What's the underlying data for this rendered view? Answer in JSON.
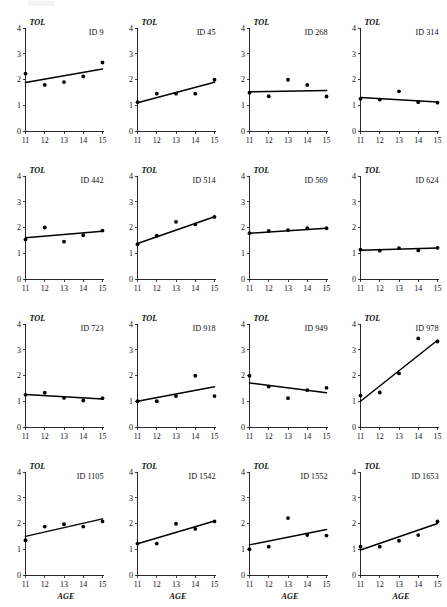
{
  "figure": {
    "panel_count": 16,
    "rows": 4,
    "columns": 4,
    "y_axis_label": "TOL",
    "x_axis_label": "AGE",
    "y_ticks": [
      "0",
      "1",
      "2",
      "3",
      "4"
    ],
    "x_ticks": [
      "11",
      "12",
      "13",
      "14",
      "15"
    ],
    "point_color": "#000000",
    "line_color": "#000000",
    "axis_color": "#111111"
  },
  "chart_data": {
    "type": "scatter",
    "title": "",
    "xlabel": "AGE",
    "ylabel": "TOL",
    "xlim": [
      11,
      15
    ],
    "ylim": [
      0,
      4
    ],
    "x": [
      11,
      12,
      13,
      14,
      15
    ],
    "grid": false,
    "legend": "none",
    "panel_label_prefix": "ID",
    "panels": [
      {
        "id": "ID 9",
        "values": [
          2.23,
          1.79,
          1.9,
          2.12,
          2.66
        ],
        "fit": {
          "y_at_11": 1.88,
          "y_at_15": 2.41
        }
      },
      {
        "id": "ID 45",
        "values": [
          1.12,
          1.45,
          1.45,
          1.45,
          1.99
        ],
        "fit": {
          "y_at_11": 1.1,
          "y_at_15": 1.89
        }
      },
      {
        "id": "ID 268",
        "values": [
          1.49,
          1.35,
          1.99,
          1.79,
          1.34
        ],
        "fit": {
          "y_at_11": 1.52,
          "y_at_15": 1.57
        }
      },
      {
        "id": "ID 314",
        "values": [
          1.25,
          1.22,
          1.54,
          1.12,
          1.1
        ],
        "fit": {
          "y_at_11": 1.3,
          "y_at_15": 1.13
        }
      },
      {
        "id": "ID 442",
        "values": [
          1.53,
          2.0,
          1.45,
          1.7,
          1.88
        ],
        "fit": {
          "y_at_11": 1.6,
          "y_at_15": 1.85
        }
      },
      {
        "id": "ID 514",
        "values": [
          1.35,
          1.68,
          2.22,
          2.12,
          2.41
        ],
        "fit": {
          "y_at_11": 1.38,
          "y_at_15": 2.42
        }
      },
      {
        "id": "ID 569",
        "values": [
          1.78,
          1.87,
          1.9,
          1.97,
          1.97
        ],
        "fit": {
          "y_at_11": 1.78,
          "y_at_15": 1.97
        }
      },
      {
        "id": "ID 624",
        "values": [
          1.14,
          1.1,
          1.2,
          1.11,
          1.21
        ],
        "fit": {
          "y_at_11": 1.12,
          "y_at_15": 1.2
        }
      },
      {
        "id": "ID 723",
        "values": [
          1.25,
          1.33,
          1.13,
          1.03,
          1.12
        ],
        "fit": {
          "y_at_11": 1.26,
          "y_at_15": 1.09
        }
      },
      {
        "id": "ID 918",
        "values": [
          1.0,
          1.0,
          1.2,
          1.99,
          1.2
        ],
        "fit": {
          "y_at_11": 1.0,
          "y_at_15": 1.56
        }
      },
      {
        "id": "ID 949",
        "values": [
          1.99,
          1.57,
          1.12,
          1.43,
          1.52
        ],
        "fit": {
          "y_at_11": 1.71,
          "y_at_15": 1.33
        }
      },
      {
        "id": "ID 978",
        "values": [
          1.22,
          1.34,
          2.08,
          3.44,
          3.32
        ],
        "fit": {
          "y_at_11": 1.0,
          "y_at_15": 3.37
        }
      },
      {
        "id": "ID 1105",
        "values": [
          1.35,
          1.88,
          1.97,
          1.88,
          2.08
        ],
        "fit": {
          "y_at_11": 1.5,
          "y_at_15": 2.18
        }
      },
      {
        "id": "ID 1542",
        "values": [
          1.22,
          1.22,
          1.99,
          1.79,
          2.08
        ],
        "fit": {
          "y_at_11": 1.21,
          "y_at_15": 2.1
        }
      },
      {
        "id": "ID 1552",
        "values": [
          1.0,
          1.1,
          2.21,
          1.55,
          1.53
        ],
        "fit": {
          "y_at_11": 1.17,
          "y_at_15": 1.77
        }
      },
      {
        "id": "ID 1653",
        "values": [
          1.1,
          1.1,
          1.33,
          1.55,
          2.08
        ],
        "fit": {
          "y_at_11": 0.97,
          "y_at_15": 2.0
        }
      }
    ]
  }
}
